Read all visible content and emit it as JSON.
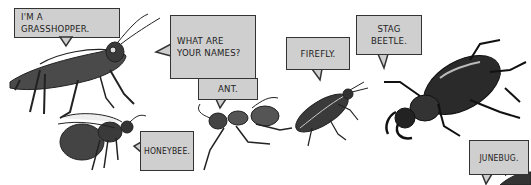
{
  "comic": {
    "bubbles": {
      "grasshopper": "I'M A\nGRASSHOPPER.",
      "question": "WHAT ARE\nYOUR NAMES?",
      "ant": "ANT.",
      "firefly": "FIREFLY.",
      "stag_beetle": "STAG\nBEETLE.",
      "honeybee": "HONEYBEE.",
      "junebug": "JUNEBUG."
    },
    "insects": [
      "grasshopper",
      "honeybee",
      "ant",
      "firefly",
      "stag beetle",
      "junebug"
    ],
    "colors": {
      "bubble_fill": "#cfcfcf",
      "ink": "#2a2a2a",
      "background": "#ffffff"
    }
  }
}
